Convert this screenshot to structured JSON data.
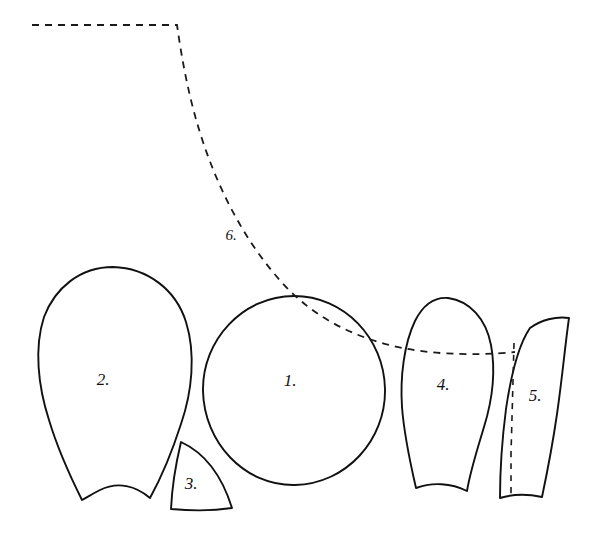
{
  "figure": {
    "background_color": "#ffffff",
    "ink_color": "#111111",
    "width": 613,
    "height": 533
  },
  "pieces": [
    {
      "id": "piece-1",
      "label": "1.",
      "shape": "circle",
      "description": "Large circle",
      "label_x": 290,
      "label_y": 386
    },
    {
      "id": "piece-2",
      "label": "2.",
      "shape": "teardrop-notched",
      "description": "Large inverted teardrop with concave notched base",
      "label_x": 103,
      "label_y": 385
    },
    {
      "id": "piece-3",
      "label": "3.",
      "shape": "wedge",
      "description": "Small quarter-circle wedge",
      "label_x": 191,
      "label_y": 487
    },
    {
      "id": "piece-4",
      "label": "4.",
      "shape": "teardrop-flat-base",
      "description": "Medium teardrop with flat base",
      "label_x": 443,
      "label_y": 389
    },
    {
      "id": "piece-5",
      "label": "5.",
      "shape": "curved-strip",
      "description": "Narrow curved strip with vertical dashed fold line",
      "label_x": 535,
      "label_y": 400
    }
  ],
  "curve": {
    "id": "curve-6",
    "label": "6.",
    "style": "dashed",
    "description": "Dashed guide curve running from upper left, bending down and flattening to the right",
    "label_x": 231,
    "label_y": 240
  }
}
